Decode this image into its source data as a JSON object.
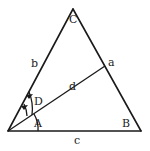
{
  "diagram": {
    "type": "triangle-geometry",
    "colors": {
      "stroke": "#1a1a1a",
      "text": "#222222",
      "background": "#ffffff"
    },
    "vertices": {
      "left": {
        "x": 8,
        "y": 131
      },
      "top": {
        "x": 73,
        "y": 9
      },
      "right": {
        "x": 141,
        "y": 131
      }
    },
    "segment_d_end": {
      "x": 105,
      "y": 66
    },
    "labels": {
      "vertex_C": "C",
      "side_b": "b",
      "side_a": "a",
      "segment_d": "d",
      "angle_D": "D",
      "angle_A": "A",
      "angle_B": "B",
      "side_c": "c"
    }
  }
}
